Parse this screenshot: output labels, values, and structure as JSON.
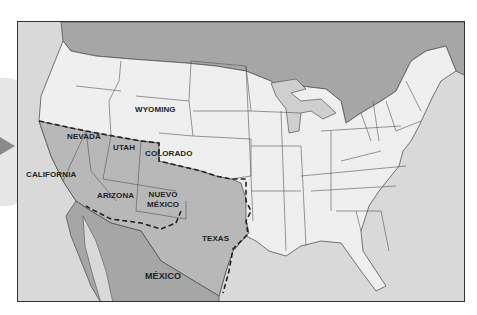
{
  "map": {
    "labels": {
      "wyoming": "WYOMING",
      "nevada": "NEVADA",
      "utah": "UTAH",
      "colorado": "COLORADO",
      "california": "CALIFORNIA",
      "arizona": "ARIZONA",
      "nuevo_mexico_line1": "NUEVO",
      "nuevo_mexico_line2": "MÉXICO",
      "texas": "TEXAS",
      "mexico": "MÉXICO"
    },
    "colors": {
      "ocean": "#d9d9d9",
      "us_states": "#efefef",
      "ceded_territory": "#b8b8b8",
      "mexico_canada": "#a6a6a6",
      "border_line": "#555555",
      "dashed_boundary": "#222222",
      "nav_arrow": "#8a8a8a"
    }
  }
}
